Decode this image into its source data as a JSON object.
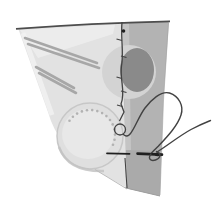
{
  "figure": {
    "elements": {
      "fabric_front": "front face of folded fabric piece",
      "fabric_back": "back gray face of folded fabric piece",
      "fold_seam": "vertical folded edge with running slip stitches and top knot",
      "stripes": "two pairs of diagonal gray stripes",
      "dark_circle": "dark gray circle motif with light halo at the fold",
      "light_circle": "large light circle with dotted stitch marks",
      "needle": "hand-sewing needle passing through the fold",
      "thread": "thread with small stitch loop, large loop and trailing tail"
    }
  },
  "colors": {
    "background": "#ffffff",
    "fabricFront": "#e2e2e2",
    "fabricFrontLight": "#efefef",
    "fabricBack": "#b3b3b3",
    "fabricBackShade": "#aaaaaa",
    "foldHighlight": "#cccccc",
    "outline": "#4d4d4d",
    "edgeFaint": "#a3a3a3",
    "stripe": "#a7a7a7",
    "darkCircle": "#8a8a8a",
    "halo": "#d3d3d3",
    "bigCircle": "#dfdfdf",
    "bigCircleInner": "#e8e8e8",
    "bigCircleEdge": "#c7c7c7",
    "shadowArc": "#c3c3c3",
    "dots": "#b2b2b2",
    "needle": "#1f1f1f",
    "thread": "#424242"
  }
}
